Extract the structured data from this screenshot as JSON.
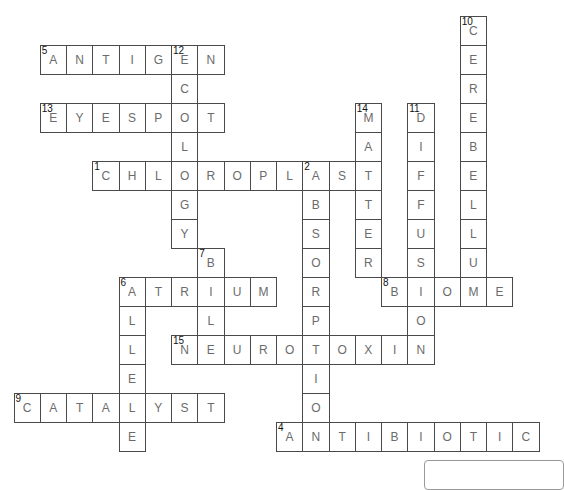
{
  "puzzle": {
    "grid_origin": {
      "x": 13.5,
      "y": 16
    },
    "cell_size": {
      "w": 26.25,
      "h": 29
    },
    "colors": {
      "border": "#4a4a4a",
      "letter": "#6b6b6b",
      "number": "#111111"
    },
    "words": [
      {
        "number": "1",
        "direction": "across",
        "row": 5,
        "col": 3,
        "answer": "CHLOROPLAST"
      },
      {
        "number": "2",
        "direction": "down",
        "row": 5,
        "col": 11,
        "answer": "ABSORPTION"
      },
      {
        "number": "4",
        "direction": "across",
        "row": 14,
        "col": 10,
        "answer": "ANTIBIOTIC"
      },
      {
        "number": "5",
        "direction": "across",
        "row": 1,
        "col": 1,
        "answer": "ANTIGEN"
      },
      {
        "number": "6",
        "direction": "across",
        "row": 9,
        "col": 4,
        "answer": "ATRIUM"
      },
      {
        "number": "6",
        "direction": "down",
        "row": 9,
        "col": 4,
        "answer": "ALLELE"
      },
      {
        "number": "7",
        "direction": "down",
        "row": 8,
        "col": 7,
        "answer": "BILE"
      },
      {
        "number": "8",
        "direction": "across",
        "row": 9,
        "col": 14,
        "answer": "BIOME"
      },
      {
        "number": "9",
        "direction": "across",
        "row": 13,
        "col": 0,
        "answer": "CATALYST"
      },
      {
        "number": "10",
        "direction": "down",
        "row": 0,
        "col": 17,
        "answer": "CEREBELLUM"
      },
      {
        "number": "11",
        "direction": "down",
        "row": 3,
        "col": 15,
        "answer": "DIFFUSION"
      },
      {
        "number": "12",
        "direction": "down",
        "row": 1,
        "col": 6,
        "answer": "ECOLOGY"
      },
      {
        "number": "13",
        "direction": "across",
        "row": 3,
        "col": 1,
        "answer": "EYESPOT"
      },
      {
        "number": "14",
        "direction": "down",
        "row": 3,
        "col": 13,
        "answer": "MATTER"
      },
      {
        "number": "15",
        "direction": "across",
        "row": 11,
        "col": 6,
        "answer": "NEUROTOXIN"
      }
    ]
  }
}
